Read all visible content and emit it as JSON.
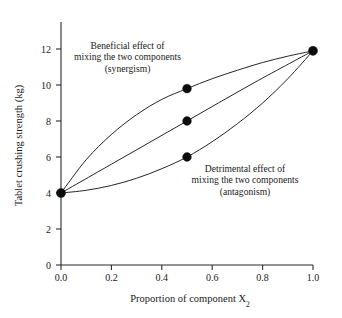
{
  "chart_data": {
    "type": "line",
    "title": "",
    "xlabel": "Proportion of component X",
    "xlabel_sub": "2",
    "ylabel": "Tablet crushing strength (kg)",
    "xlim": [
      0.0,
      1.0
    ],
    "ylim": [
      0,
      13.2
    ],
    "xticks": [
      "0.0",
      "0.2",
      "0.4",
      "0.6",
      "0.8",
      "1.0"
    ],
    "xtick_values": [
      0.0,
      0.2,
      0.4,
      0.6,
      0.8,
      1.0
    ],
    "yticks": [
      "0",
      "2",
      "4",
      "6",
      "8",
      "10",
      "12"
    ],
    "ytick_values": [
      0,
      2,
      4,
      6,
      8,
      10,
      12
    ],
    "grid": false,
    "legend": "none",
    "series": [
      {
        "name": "Beneficial effect of mixing the two components (synergism)",
        "x": [
          0.0,
          0.1,
          0.2,
          0.3,
          0.4,
          0.5,
          0.6,
          0.7,
          0.8,
          0.9,
          1.0
        ],
        "values": [
          4.0,
          5.85,
          7.25,
          8.35,
          9.2,
          9.8,
          10.35,
          10.82,
          11.25,
          11.6,
          11.9
        ],
        "marker_points": [
          {
            "x": 0.5,
            "y": 9.8
          }
        ]
      },
      {
        "name": "Additive (straight line) response",
        "x": [
          0.0,
          0.25,
          0.5,
          0.75,
          1.0
        ],
        "values": [
          4.0,
          6.0,
          8.0,
          10.0,
          11.9
        ],
        "marker_points": [
          {
            "x": 0.5,
            "y": 8.0
          }
        ]
      },
      {
        "name": "Detrimental effect of mixing the two components (antagonism)",
        "x": [
          0.0,
          0.1,
          0.2,
          0.3,
          0.4,
          0.5,
          0.6,
          0.7,
          0.8,
          0.9,
          1.0
        ],
        "values": [
          4.0,
          4.15,
          4.42,
          4.82,
          5.35,
          6.0,
          6.85,
          7.85,
          9.0,
          10.35,
          11.9
        ],
        "marker_points": [
          {
            "x": 0.5,
            "y": 6.0
          }
        ]
      }
    ],
    "endpoints": [
      {
        "x": 0.0,
        "y": 4.0
      },
      {
        "x": 1.0,
        "y": 11.9
      }
    ],
    "annotations": [
      {
        "name": "synergism",
        "lines": [
          "Beneficial effect of",
          "mixing the two components",
          "(synergism)"
        ]
      },
      {
        "name": "antagonism",
        "lines": [
          "Detrimental effect of",
          "mixing the two components",
          "(antagonism)"
        ]
      }
    ],
    "colors": {
      "curve": "#1a1a1a",
      "marker": "#0c0c0c",
      "axis": "#2b2b2b",
      "background": "#ffffff",
      "text": "#1a1a1a"
    }
  }
}
